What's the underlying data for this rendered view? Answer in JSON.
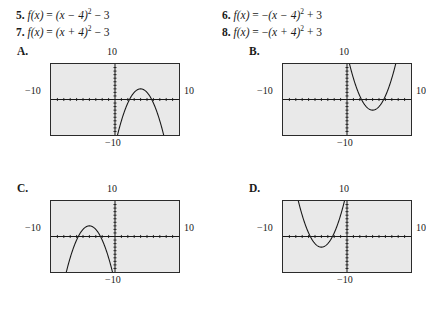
{
  "problems": [
    {
      "number": "5.",
      "fx": "f(x)",
      "eq": "= (x − 4)² − 3",
      "lhs": "(x − 4)",
      "exp": "2",
      "rhs": " − 3",
      "sign": ""
    },
    {
      "number": "7.",
      "fx": "f(x)",
      "eq": "= (x + 4)² − 3",
      "lhs": "(x + 4)",
      "exp": "2",
      "rhs": " − 3",
      "sign": ""
    },
    {
      "number": "6.",
      "fx": "f(x)",
      "eq": "= −(x − 4)² + 3",
      "lhs": "(x − 4)",
      "exp": "2",
      "rhs": " + 3",
      "sign": "−"
    },
    {
      "number": "8.",
      "fx": "f(x)",
      "eq": "= −(x + 4)² + 3",
      "lhs": "(x + 4)",
      "exp": "2",
      "rhs": " + 3",
      "sign": "−"
    }
  ],
  "equals": "=",
  "graph_window": {
    "xmin": -10,
    "xmax": 10,
    "ymin": -10,
    "ymax": 10,
    "label_top": "10",
    "label_left": "−10",
    "label_right": "10",
    "label_bottom": "−10",
    "screen_bg": "#e9e9e9",
    "border_color": "#2b2b2b",
    "curve_color": "#1a1a1a"
  },
  "panels": [
    {
      "letter": "A.",
      "chart_data": {
        "type": "line",
        "title": "A.",
        "xlabel": "",
        "ylabel": "",
        "xlim": [
          -10,
          10
        ],
        "ylim": [
          -10,
          10
        ],
        "grid": false,
        "legend": "none",
        "tick_marks": "dotted on both axes, 1-unit spacing",
        "equation": "f(x) = -(x - 4)^2 + 3",
        "vertex": [
          4,
          3
        ],
        "opens": "down",
        "leading_coefficient": -1,
        "x_intercepts": [
          2.27,
          5.73
        ],
        "annotations": [
          "10",
          "-10",
          "10",
          "-10"
        ]
      }
    },
    {
      "letter": "B.",
      "chart_data": {
        "type": "line",
        "title": "B.",
        "xlabel": "",
        "ylabel": "",
        "xlim": [
          -10,
          10
        ],
        "ylim": [
          -10,
          10
        ],
        "grid": false,
        "legend": "none",
        "tick_marks": "dotted on both axes, 1-unit spacing",
        "equation": "f(x) = (x - 4)^2 - 3",
        "vertex": [
          4,
          -3
        ],
        "opens": "up",
        "leading_coefficient": 1,
        "x_intercepts": [
          2.27,
          5.73
        ],
        "annotations": [
          "10",
          "-10",
          "10",
          "-10"
        ]
      }
    },
    {
      "letter": "C.",
      "chart_data": {
        "type": "line",
        "title": "C.",
        "xlabel": "",
        "ylabel": "",
        "xlim": [
          -10,
          10
        ],
        "ylim": [
          -10,
          10
        ],
        "grid": false,
        "legend": "none",
        "tick_marks": "dotted on both axes, 1-unit spacing",
        "equation": "f(x) = -(x + 4)^2 + 3",
        "vertex": [
          -4,
          3
        ],
        "opens": "down",
        "leading_coefficient": -1,
        "x_intercepts": [
          -5.73,
          -2.27
        ],
        "annotations": [
          "10",
          "-10",
          "10",
          "-10"
        ]
      }
    },
    {
      "letter": "D.",
      "chart_data": {
        "type": "line",
        "title": "D.",
        "xlabel": "",
        "ylabel": "",
        "xlim": [
          -10,
          10
        ],
        "ylim": [
          -10,
          10
        ],
        "grid": false,
        "legend": "none",
        "tick_marks": "dotted on both axes, 1-unit spacing",
        "equation": "f(x) = (x + 4)^2 - 3",
        "vertex": [
          -4,
          -3
        ],
        "opens": "up",
        "leading_coefficient": 1,
        "x_intercepts": [
          -5.73,
          -2.27
        ],
        "annotations": [
          "10",
          "-10",
          "10",
          "-10"
        ]
      }
    }
  ]
}
